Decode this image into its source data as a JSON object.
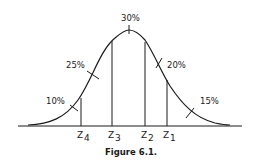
{
  "figure": {
    "caption": "Figure 6.1.",
    "regions": [
      {
        "label": "10%",
        "between": "left tail to Z4"
      },
      {
        "label": "25%",
        "between": "Z4 to Z3"
      },
      {
        "label": "30%",
        "between": "Z3 to Z2"
      },
      {
        "label": "20%",
        "between": "Z2 to Z1"
      },
      {
        "label": "15%",
        "between": "Z1 to right tail"
      }
    ],
    "cutoffs": [
      {
        "name": "Z",
        "sub": "4"
      },
      {
        "name": "Z",
        "sub": "3"
      },
      {
        "name": "Z",
        "sub": "2"
      },
      {
        "name": "Z",
        "sub": "1"
      }
    ],
    "line_color": "#1a1a1a"
  }
}
